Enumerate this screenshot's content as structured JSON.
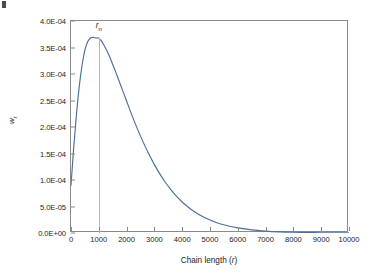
{
  "chart_data": {
    "type": "line",
    "title": "",
    "subtitle": "",
    "xlabel": "Chain length (r)",
    "ylabel": "w_r",
    "xlim": [
      0,
      10000
    ],
    "ylim": [
      0.0,
      0.0004
    ],
    "grid": false,
    "legend": null,
    "legend_position": "none",
    "series_color": "#4a6f9c",
    "x_tick_labels": [
      "0",
      "1000",
      "2000",
      "3000",
      "4000",
      "5000",
      "6000",
      "7000",
      "8000",
      "9000",
      "10000"
    ],
    "x_tick_values": [
      0,
      1000,
      2000,
      3000,
      4000,
      5000,
      6000,
      7000,
      8000,
      9000,
      10000
    ],
    "y_tick_labels": [
      "0.0E+00",
      "5.0E-05",
      "1.0E-04",
      "1.5E-04",
      "2.0E-04",
      "2.5E-04",
      "3.0E-04",
      "3.5E-04",
      "4.0E-04"
    ],
    "y_tick_values": [
      0.0,
      5e-05,
      0.0001,
      0.00015,
      0.0002,
      0.00025,
      0.0003,
      0.00035,
      0.0004
    ],
    "annotations": [
      {
        "label": "r",
        "sublabel": "n",
        "x": 1000,
        "y": 0.000368,
        "kind": "vertical-marker-line"
      }
    ],
    "series": [
      {
        "name": "chain length distribution",
        "x": [
          0,
          100,
          200,
          300,
          400,
          500,
          600,
          700,
          800,
          900,
          1000,
          1100,
          1200,
          1300,
          1400,
          1500,
          1600,
          1800,
          2000,
          2200,
          2400,
          2600,
          2800,
          3000,
          3200,
          3400,
          3600,
          3800,
          4000,
          4400,
          4800,
          5200,
          5600,
          6000,
          6500,
          7000,
          7500,
          8000,
          8500,
          9000,
          9500,
          10000
        ],
        "y": [
          9e-05,
          0.000163,
          0.000226,
          0.000278,
          0.000317,
          0.000345,
          0.000361,
          0.000368,
          0.000369,
          0.000368,
          0.000368,
          0.000362,
          0.000353,
          0.000343,
          0.000331,
          0.000318,
          0.000305,
          0.000277,
          0.000249,
          0.000221,
          0.000195,
          0.000171,
          0.000149,
          0.000129,
          0.000111,
          9.52e-05,
          8.12e-05,
          6.9e-05,
          5.84e-05,
          4.14e-05,
          2.91e-05,
          2.03e-05,
          1.41e-05,
          9.75e-06,
          5.97e-06,
          3.63e-06,
          2.2e-06,
          1.33e-06,
          8e-07,
          4.8e-07,
          2.9e-07,
          1.7e-07
        ]
      }
    ]
  },
  "axis": {
    "x_label_text": "Chain length (",
    "x_label_var": "r",
    "x_label_tail": ")",
    "y_label_var": "w",
    "y_label_sub": "r"
  },
  "peak_annotation": {
    "var": "r",
    "sub": "n"
  }
}
